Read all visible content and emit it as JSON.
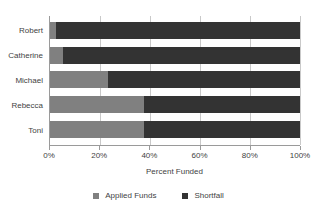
{
  "chart_data": {
    "type": "bar",
    "orientation": "horizontal",
    "stacked": true,
    "percent_stacked": true,
    "title": "",
    "xlabel": "Percent Funded",
    "ylabel": "",
    "xlim": [
      0,
      100
    ],
    "xticks": [
      0,
      20,
      40,
      60,
      80,
      100
    ],
    "xtick_labels": [
      "0%",
      "20%",
      "40%",
      "60%",
      "80%",
      "100%"
    ],
    "grid": true,
    "grid_axis": "x",
    "legend_position": "bottom",
    "categories": [
      "Robert",
      "Catherine",
      "Michael",
      "Rebecca",
      "Toni"
    ],
    "series": [
      {
        "name": "Applied Funds",
        "color": "#808080",
        "values": [
          2.5,
          5,
          23,
          37.5,
          37.5
        ]
      },
      {
        "name": "Shortfall",
        "color": "#333333",
        "values": [
          97.5,
          95,
          77,
          62.5,
          62.5
        ]
      }
    ]
  },
  "legend": {
    "items": [
      {
        "label": "Applied Funds",
        "color": "#808080"
      },
      {
        "label": "Shortfall",
        "color": "#333333"
      }
    ]
  },
  "colors": {
    "applied_funds": "#808080",
    "shortfall": "#333333",
    "axis": "#9a9a9a",
    "gridline": "#c9c9c9",
    "text": "#3f3f3f",
    "background": "#ffffff"
  }
}
